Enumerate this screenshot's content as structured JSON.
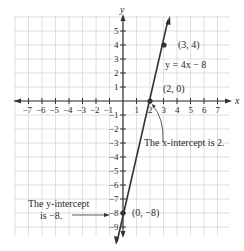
{
  "figure": {
    "axis_x_label": "x",
    "axis_y_label": "y",
    "x_ticks": [
      "-7",
      "-6",
      "-5",
      "-4",
      "-3",
      "-2",
      "-1",
      "1",
      "2",
      "3",
      "4",
      "5",
      "6",
      "7"
    ],
    "y_ticks": [
      "5",
      "4",
      "3",
      "2",
      "1",
      "-1",
      "-2",
      "-3",
      "-4",
      "-5",
      "-6",
      "-7",
      "-8",
      "-9"
    ],
    "equation": "y = 4x − 8",
    "points": [
      {
        "label": "(3, 4)",
        "x": 3,
        "y": 4
      },
      {
        "label": "(2, 0)",
        "x": 2,
        "y": 0
      },
      {
        "label": "(0, −8)",
        "x": 0,
        "y": -8
      }
    ],
    "annotations": {
      "x_intercept": "The x-intercept is 2.",
      "y_intercept_line1": "The y-intercept",
      "y_intercept_line2": "is −8."
    },
    "colors": {
      "line": "#333333",
      "grid": "#d6d6d6",
      "axis": "#333333"
    }
  }
}
